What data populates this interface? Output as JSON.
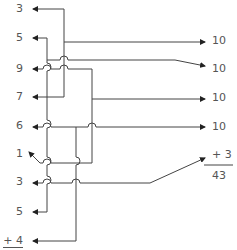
{
  "left_numbers": [
    {
      "label": "3",
      "y": 3
    },
    {
      "label": "5",
      "y": 32
    },
    {
      "label": "9",
      "y": 63
    },
    {
      "label": "7",
      "y": 91
    },
    {
      "label": "6",
      "y": 120
    },
    {
      "label": "1",
      "y": 148
    },
    {
      "label": "3",
      "y": 176
    },
    {
      "label": "5",
      "y": 206
    },
    {
      "label": "+ 4",
      "y": 235
    }
  ],
  "right_numbers": [
    {
      "label": "10",
      "y": 35
    },
    {
      "label": "10",
      "y": 63
    },
    {
      "label": "10",
      "y": 92
    },
    {
      "label": "10",
      "y": 121
    },
    {
      "label": "+ 3",
      "y": 149
    },
    {
      "label": "43",
      "y": 170
    }
  ],
  "sum": {
    "left_addends": [
      3,
      5,
      9,
      7,
      6,
      1,
      3,
      5,
      4
    ],
    "right_addends": [
      10,
      10,
      10,
      10,
      3
    ],
    "total": "43"
  },
  "colors": {
    "line": "#444444",
    "text": "#555555",
    "background": "#ffffff"
  }
}
